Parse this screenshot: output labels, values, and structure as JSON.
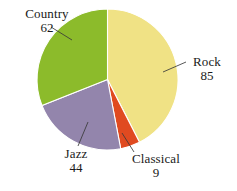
{
  "chart_data": {
    "type": "pie",
    "title": "",
    "subtitle": "",
    "xlabel": "",
    "ylabel": "",
    "legend_position": "none",
    "grid": false,
    "total": 200,
    "categories": [
      "Rock",
      "Classical",
      "Jazz",
      "Country"
    ],
    "values": [
      85,
      9,
      44,
      62
    ],
    "slices": [
      {
        "label": "Rock",
        "value": 85,
        "value_text": "85",
        "color": "#f0e285",
        "percent": 42.5,
        "angle_deg": 153.0,
        "start_angle_deg": 0.0,
        "end_angle_deg": 153.0,
        "leader": true
      },
      {
        "label": "Classical",
        "value": 9,
        "value_text": "9",
        "color": "#e04a20",
        "percent": 4.5,
        "angle_deg": 16.2,
        "start_angle_deg": 153.0,
        "end_angle_deg": 169.2,
        "leader": true
      },
      {
        "label": "Jazz",
        "value": 44,
        "value_text": "44",
        "color": "#9385ac",
        "percent": 22.0,
        "angle_deg": 79.2,
        "start_angle_deg": 169.2,
        "end_angle_deg": 248.4,
        "leader": true
      },
      {
        "label": "Country",
        "value": 62,
        "value_text": "62",
        "color": "#8cbb2b",
        "percent": 31.0,
        "angle_deg": 111.6,
        "start_angle_deg": 248.4,
        "end_angle_deg": 360.0,
        "leader": true
      }
    ],
    "geometry": {
      "center_x": 107.5,
      "center_y": 79.5,
      "radius": 70.5,
      "start_at_twelve_oclock": true,
      "direction": "clockwise"
    },
    "colors": {
      "rock": "#f0e285",
      "classical": "#e04a20",
      "jazz": "#9385ac",
      "country": "#8cbb2b",
      "background": "#ffffff",
      "slice_border": "#ffffff",
      "leader_line": "#3a3a3a",
      "text": "#1a1a1a"
    }
  },
  "labels": {
    "country": {
      "name": "Country",
      "value": "62"
    },
    "rock": {
      "name": "Rock",
      "value": "85"
    },
    "jazz": {
      "name": "Jazz",
      "value": "44"
    },
    "classical": {
      "name": "Classical",
      "value": "9"
    }
  }
}
